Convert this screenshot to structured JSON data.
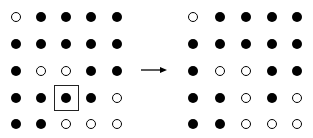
{
  "diagram": {
    "before": {
      "grid": [
        [
          0,
          1,
          1,
          1,
          1
        ],
        [
          1,
          1,
          1,
          1,
          1
        ],
        [
          1,
          0,
          0,
          1,
          1
        ],
        [
          1,
          1,
          1,
          1,
          0
        ],
        [
          1,
          1,
          0,
          0,
          0
        ]
      ],
      "highlight": {
        "row": 3,
        "col": 2
      }
    },
    "after": {
      "grid": [
        [
          0,
          1,
          1,
          1,
          1
        ],
        [
          1,
          1,
          1,
          1,
          1
        ],
        [
          1,
          0,
          0,
          1,
          1
        ],
        [
          1,
          1,
          0,
          1,
          0
        ],
        [
          1,
          1,
          0,
          0,
          0
        ]
      ]
    },
    "legend": {
      "filled": "live cell (filled circle)",
      "empty": "dead cell (open circle)"
    },
    "arrow": "right-arrow"
  }
}
